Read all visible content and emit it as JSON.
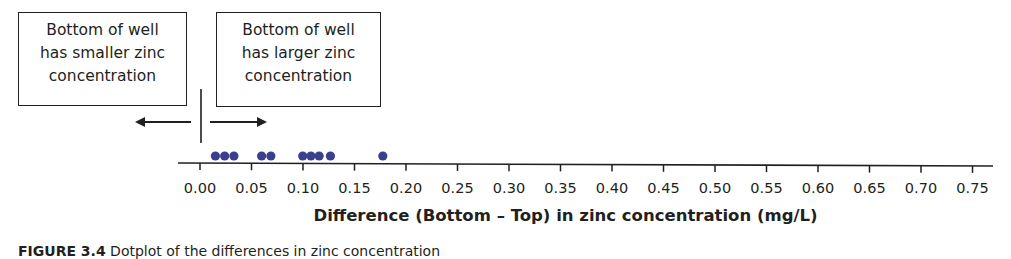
{
  "annotations": {
    "left_box": [
      "Bottom of well",
      "has smaller zinc",
      "concentration"
    ],
    "right_box": [
      "Bottom of well",
      "has larger zinc",
      "concentration"
    ],
    "left_arrow": "arrow-left",
    "right_arrow": "arrow-right"
  },
  "caption": {
    "label": "FIGURE 3.4",
    "text": "Dotplot of the differences in zinc concentration"
  },
  "colors": {
    "dot": "#3b3f8f",
    "axis": "#231f20",
    "text": "#231f20"
  },
  "chart_data": {
    "type": "scatter",
    "subtype": "dotplot",
    "title": "",
    "xlabel": "Difference (Bottom – Top) in zinc concentration (mg/L)",
    "ylabel": "",
    "xlim": [
      0.0,
      0.75
    ],
    "xticks": [
      "0.00",
      "0.05",
      "0.10",
      "0.15",
      "0.20",
      "0.25",
      "0.30",
      "0.35",
      "0.40",
      "0.45",
      "0.50",
      "0.55",
      "0.60",
      "0.65",
      "0.70",
      "0.75"
    ],
    "grid": false,
    "legend": null,
    "values": [
      0.015,
      0.024,
      0.033,
      0.06,
      0.069,
      0.1,
      0.108,
      0.116,
      0.127,
      0.178
    ],
    "reference_line": 0.0,
    "annotations": [
      {
        "side": "left",
        "text": "Bottom of well has smaller zinc concentration"
      },
      {
        "side": "right",
        "text": "Bottom of well has larger zinc concentration"
      }
    ]
  }
}
